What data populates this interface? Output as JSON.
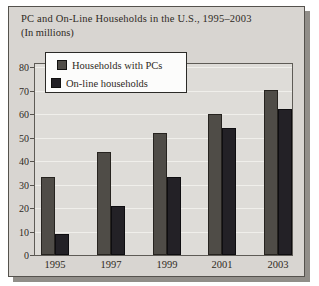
{
  "panel": {
    "title": "PC and On-Line Households in the U.S., 1995–2003",
    "subtitle": "(In millions)"
  },
  "legend": {
    "items": [
      {
        "label": "Households with PCs",
        "color": "#4f4c47"
      },
      {
        "label": "On-line households",
        "color": "#232126"
      }
    ]
  },
  "chart_data": {
    "type": "bar",
    "title": "PC and On-Line Households in the U.S., 1995–2003",
    "subtitle": "(In millions)",
    "categories": [
      "1995",
      "1997",
      "1999",
      "2001",
      "2003"
    ],
    "series": [
      {
        "name": "Households with PCs",
        "color": "#4f4c47",
        "border_color": "#26231f",
        "values": [
          33,
          44,
          52,
          60,
          70
        ]
      },
      {
        "name": "On-line households",
        "color": "#232126",
        "border_color": "#0e0d10",
        "values": [
          9,
          21,
          33,
          54,
          62
        ]
      }
    ],
    "ylabel": "",
    "xlabel": "",
    "ylim": [
      0,
      80
    ],
    "yticks": [
      0,
      10,
      20,
      30,
      40,
      50,
      60,
      70,
      80
    ],
    "grid": true,
    "legend_position": "top-left"
  },
  "colors": {
    "page_background": "#ffffff",
    "panel_background": "#d8d5d1",
    "panel_border": "#55524d",
    "panel_shadow": "#918e89",
    "plot_background": "#dedcd8",
    "gridline": "#f0efeb",
    "text": "#2f2a24",
    "legend_background": "#fcfcfb"
  }
}
